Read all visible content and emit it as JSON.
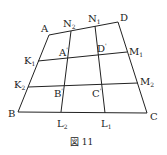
{
  "figure": {
    "caption": "図 11",
    "points": {
      "A": {
        "label": "A"
      },
      "B": {
        "label": "B"
      },
      "C": {
        "label": "C"
      },
      "D": {
        "label": "D"
      },
      "A1": {
        "label": "A",
        "prime": "'"
      },
      "B1": {
        "label": "B",
        "prime": "'"
      },
      "C1": {
        "label": "C",
        "prime": "'"
      },
      "D1": {
        "label": "D",
        "prime": "'"
      },
      "K1": {
        "label": "K",
        "sub": "1"
      },
      "K2": {
        "label": "K",
        "sub": "2"
      },
      "M1": {
        "label": "M",
        "sub": "1"
      },
      "M2": {
        "label": "M",
        "sub": "2"
      },
      "N1": {
        "label": "N",
        "sub": "1"
      },
      "N2": {
        "label": "N",
        "sub": "2"
      },
      "L1": {
        "label": "L",
        "sub": "1"
      },
      "L2": {
        "label": "L",
        "sub": "2"
      }
    }
  }
}
